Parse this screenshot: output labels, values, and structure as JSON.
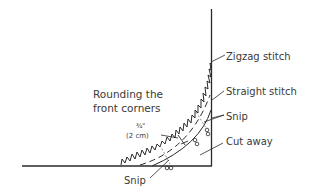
{
  "diagram": {
    "title_line1": "Rounding the",
    "title_line2": "front corners",
    "measurement_line1": "¾\"",
    "measurement_line2": "(2 cm)",
    "labels": {
      "zigzag": "Zigzag stitch",
      "straight": "Straight stitch",
      "snip_upper": "Snip",
      "cut_away": "Cut away",
      "snip_lower": "Snip"
    },
    "colors": {
      "ink": "#2a2a2a",
      "text": "#3a3a3a",
      "background": "#ffffff"
    }
  }
}
